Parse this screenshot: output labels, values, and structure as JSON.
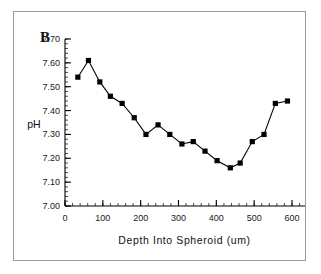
{
  "figure": {
    "panel_letter": "B",
    "background_color": "#ffffff",
    "border_color": "#9a9a9a",
    "series_color": "#000000"
  },
  "chart_data": {
    "type": "line",
    "title": "",
    "subtitle": "",
    "xlabel": "Depth Into Spheroid (um)",
    "ylabel": "pH",
    "xlim": [
      0,
      600
    ],
    "ylim": [
      7.0,
      7.7
    ],
    "xticks": [
      0,
      100,
      200,
      300,
      400,
      500,
      600
    ],
    "xtick_labels": [
      "0",
      "100",
      "200",
      "300",
      "400",
      "500",
      "600"
    ],
    "yticks": [
      7.0,
      7.1,
      7.2,
      7.3,
      7.4,
      7.5,
      7.6,
      7.7
    ],
    "ytick_labels": [
      "7.00",
      "7.10",
      "7.20",
      "7.30",
      "7.40",
      "7.50",
      "7.60",
      "7.70"
    ],
    "x_minor_tick_step": 20,
    "y_minor_tick_step": 0.02,
    "grid": false,
    "legend": false,
    "marker": "square",
    "x": [
      34,
      62,
      92,
      120,
      151,
      183,
      214,
      246,
      277,
      309,
      339,
      370,
      402,
      437,
      463,
      495,
      526,
      556,
      588
    ],
    "y": [
      7.54,
      7.61,
      7.52,
      7.46,
      7.43,
      7.37,
      7.3,
      7.34,
      7.3,
      7.26,
      7.27,
      7.23,
      7.19,
      7.16,
      7.18,
      7.27,
      7.3,
      7.43,
      7.44
    ],
    "series": [
      {
        "name": "pH profile",
        "x": [
          34,
          62,
          92,
          120,
          151,
          183,
          214,
          246,
          277,
          309,
          339,
          370,
          402,
          437,
          463,
          495,
          526,
          556,
          588
        ],
        "values": [
          7.54,
          7.61,
          7.52,
          7.46,
          7.43,
          7.37,
          7.3,
          7.34,
          7.3,
          7.26,
          7.27,
          7.23,
          7.19,
          7.16,
          7.18,
          7.27,
          7.3,
          7.43,
          7.44
        ]
      }
    ]
  }
}
